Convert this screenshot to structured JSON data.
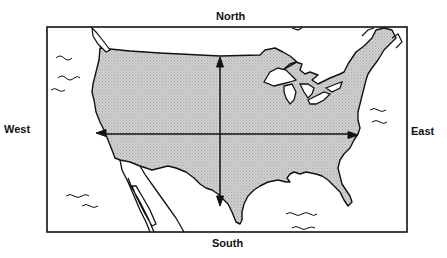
{
  "diagram": {
    "type": "map",
    "labels": {
      "north": "North",
      "south": "South",
      "west": "West",
      "east": "East"
    },
    "arrows": [
      {
        "name": "north-south-arrow",
        "orientation": "vertical",
        "double_headed": true
      },
      {
        "name": "west-east-arrow",
        "orientation": "horizontal",
        "double_headed": true
      }
    ],
    "colors": {
      "land_fill": "#c9c9c9",
      "outline": "#111111",
      "water": "#ffffff"
    }
  }
}
